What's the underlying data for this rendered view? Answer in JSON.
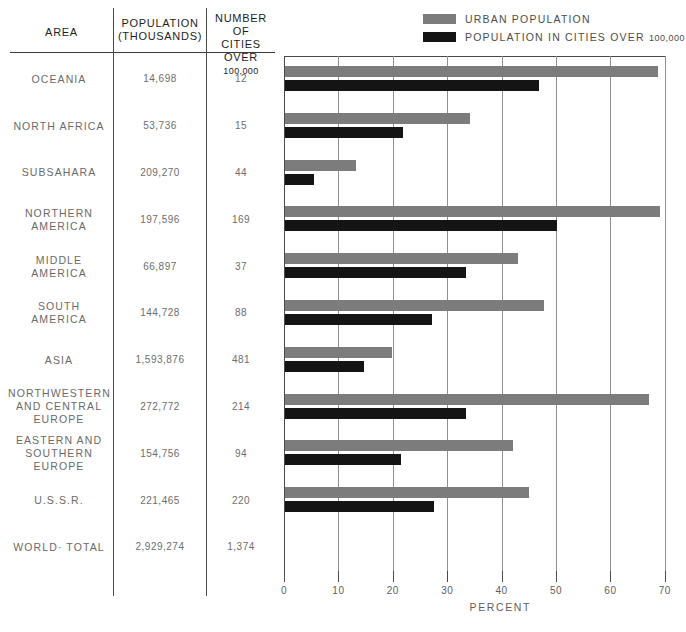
{
  "table": {
    "headers": {
      "area": "AREA",
      "population": "POPULATION (THOUSANDS)",
      "population_line1": "POPULATION",
      "population_line2": "(THOUSANDS)",
      "cities_line1": "NUMBER OF",
      "cities_line2": "CITIES OVER",
      "cities_line3": "100,000"
    },
    "rows": [
      {
        "area": "OCEANIA",
        "population": "14,698",
        "cities": "12"
      },
      {
        "area": "NORTH AFRICA",
        "population": "53,736",
        "cities": "15"
      },
      {
        "area": "SUBSAHARA",
        "population": "209,270",
        "cities": "44"
      },
      {
        "area": "NORTHERN AMERICA",
        "population": "197,596",
        "cities": "169"
      },
      {
        "area": "MIDDLE AMERICA",
        "population": "66,897",
        "cities": "37"
      },
      {
        "area": "SOUTH AMERICA",
        "population": "144,728",
        "cities": "88"
      },
      {
        "area": "ASIA",
        "population": "1,593,876",
        "cities": "481"
      },
      {
        "area": "NORTHWESTERN AND CENTRAL EUROPE",
        "population": "272,772",
        "cities": "214"
      },
      {
        "area": "EASTERN AND SOUTHERN EUROPE",
        "population": "154,756",
        "cities": "94"
      },
      {
        "area": "U.S.S.R.",
        "population": "221,465",
        "cities": "220"
      },
      {
        "area": "WORLD· TOTAL",
        "population": "2,929,274",
        "cities": "1,374"
      }
    ]
  },
  "legend": {
    "items": [
      {
        "label": "URBAN POPULATION",
        "label_small": "",
        "color": "#7c7c7c",
        "key": "urban"
      },
      {
        "label": "POPULATION IN CITIES OVER",
        "label_small": "100,000",
        "color": "#141414",
        "key": "cities"
      }
    ]
  },
  "chart_data": {
    "type": "bar",
    "orientation": "horizontal",
    "title": "",
    "xlabel": "PERCENT",
    "ylabel": "",
    "xlim": [
      0,
      70
    ],
    "xticks": [
      0,
      10,
      20,
      30,
      40,
      50,
      60,
      70
    ],
    "xtick_labels": [
      "0",
      "10",
      "20",
      "30",
      "40",
      "50",
      "60",
      "70"
    ],
    "grid": true,
    "legend_position": "top-right",
    "categories": [
      "OCEANIA",
      "NORTH AFRICA",
      "SUBSAHARA",
      "NORTHERN AMERICA",
      "MIDDLE AMERICA",
      "SOUTH AMERICA",
      "ASIA",
      "NORTHWESTERN AND CENTRAL EUROPE",
      "EASTERN AND SOUTHERN EUROPE",
      "U.S.S.R.",
      "WORLD· TOTAL"
    ],
    "series": [
      {
        "name": "URBAN POPULATION",
        "color": "#7c7c7c",
        "values": [
          68.5,
          34.0,
          13.0,
          69.0,
          42.8,
          47.6,
          19.6,
          67.0,
          41.9,
          44.8,
          null
        ]
      },
      {
        "name": "POPULATION IN CITIES OVER 100,000",
        "color": "#141414",
        "values": [
          46.7,
          21.7,
          5.3,
          50.0,
          33.3,
          27.0,
          14.6,
          33.3,
          21.3,
          27.4,
          null
        ]
      }
    ]
  }
}
